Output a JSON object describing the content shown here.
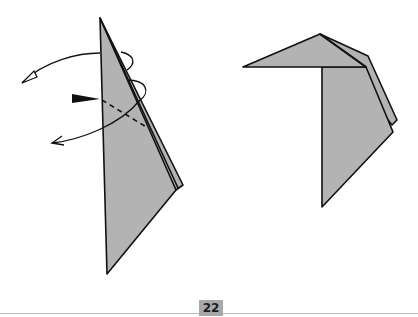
{
  "page": {
    "number": "22"
  },
  "colors": {
    "paper_fill": "#b3b3b3",
    "stroke": "#111111",
    "footer_line": "#bdbdbd",
    "badge": "#a8a8a8"
  },
  "diagrams": [
    {
      "id": "step-left",
      "description": "Narrow folded paper with dashed fold line, push arrow and turn-over arrows"
    },
    {
      "id": "step-right",
      "description": "Result: paper folded with top flap horizontal"
    }
  ]
}
